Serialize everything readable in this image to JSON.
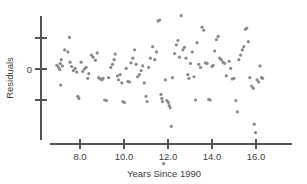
{
  "chart_data": {
    "type": "scatter",
    "title": "",
    "xlabel": "Years Since 1990",
    "ylabel": "Residuals",
    "xlim": [
      6.7,
      16.9
    ],
    "ylim": [
      -3.4,
      2.4
    ],
    "grid": false,
    "legend": null,
    "xticks": [
      8.0,
      10.0,
      12.0,
      14.0,
      16.0
    ],
    "xticklabels": [
      "8.0",
      "10.0",
      "12.0",
      "14.0",
      "16.0"
    ],
    "yticks": [
      -1.0,
      0.0,
      1.0
    ],
    "yticklabels": [
      "",
      "0",
      ""
    ],
    "point_color": "#8a8a8a",
    "axis_color": "#555555",
    "point_radius": 1.6,
    "points": [
      [
        6.95,
        0.12
      ],
      [
        7.02,
        0.05
      ],
      [
        7.1,
        0.18
      ],
      [
        7.08,
        -0.02
      ],
      [
        7.15,
        0.3
      ],
      [
        7.2,
        0.1
      ],
      [
        7.12,
        -0.52
      ],
      [
        7.3,
        0.62
      ],
      [
        7.45,
        0.55
      ],
      [
        7.52,
        1.02
      ],
      [
        7.55,
        0.22
      ],
      [
        7.62,
        0.08
      ],
      [
        7.7,
        -0.05
      ],
      [
        7.78,
        0.02
      ],
      [
        7.85,
        -0.1
      ],
      [
        7.9,
        -0.88
      ],
      [
        7.95,
        -0.95
      ],
      [
        8.05,
        0.22
      ],
      [
        8.12,
        -0.08
      ],
      [
        8.2,
        0.0
      ],
      [
        8.28,
        0.05
      ],
      [
        8.35,
        -0.3
      ],
      [
        8.4,
        -0.15
      ],
      [
        8.52,
        0.45
      ],
      [
        8.6,
        0.38
      ],
      [
        8.7,
        0.28
      ],
      [
        8.78,
        0.52
      ],
      [
        8.85,
        -0.28
      ],
      [
        8.92,
        -0.32
      ],
      [
        9.0,
        -0.35
      ],
      [
        9.05,
        -0.3
      ],
      [
        9.12,
        -1.0
      ],
      [
        9.2,
        -1.02
      ],
      [
        9.3,
        -0.28
      ],
      [
        9.4,
        0.05
      ],
      [
        9.48,
        0.15
      ],
      [
        9.55,
        0.3
      ],
      [
        9.6,
        0.48
      ],
      [
        9.7,
        -0.22
      ],
      [
        9.75,
        -0.35
      ],
      [
        9.82,
        -0.18
      ],
      [
        9.9,
        -0.45
      ],
      [
        9.95,
        -1.05
      ],
      [
        10.02,
        -1.08
      ],
      [
        10.1,
        0.02
      ],
      [
        10.18,
        -0.4
      ],
      [
        10.25,
        -0.42
      ],
      [
        10.32,
        0.2
      ],
      [
        10.4,
        0.35
      ],
      [
        10.48,
        0.62
      ],
      [
        10.55,
        0.15
      ],
      [
        10.62,
        -0.25
      ],
      [
        10.7,
        -0.18
      ],
      [
        10.78,
        -0.05
      ],
      [
        10.85,
        0.1
      ],
      [
        10.92,
        -0.45
      ],
      [
        11.0,
        -0.88
      ],
      [
        11.05,
        -1.05
      ],
      [
        11.12,
        0.05
      ],
      [
        11.2,
        0.35
      ],
      [
        11.3,
        0.72
      ],
      [
        11.4,
        0.3
      ],
      [
        11.48,
        0.55
      ],
      [
        11.55,
        1.55
      ],
      [
        11.62,
        1.58
      ],
      [
        11.68,
        -0.82
      ],
      [
        11.72,
        -0.95
      ],
      [
        11.75,
        -1.05
      ],
      [
        11.8,
        -3.05
      ],
      [
        11.88,
        -0.35
      ],
      [
        11.95,
        -1.02
      ],
      [
        12.02,
        -1.08
      ],
      [
        12.05,
        -1.18
      ],
      [
        12.1,
        -1.25
      ],
      [
        12.15,
        -1.85
      ],
      [
        12.2,
        -0.28
      ],
      [
        12.3,
        0.5
      ],
      [
        12.38,
        0.78
      ],
      [
        12.45,
        0.92
      ],
      [
        12.52,
        0.38
      ],
      [
        12.6,
        1.72
      ],
      [
        12.68,
        0.62
      ],
      [
        12.75,
        0.7
      ],
      [
        12.82,
        0.35
      ],
      [
        12.9,
        -0.18
      ],
      [
        12.95,
        -0.3
      ],
      [
        13.02,
        0.18
      ],
      [
        13.1,
        0.55
      ],
      [
        13.18,
        -0.25
      ],
      [
        13.25,
        -1.0
      ],
      [
        13.32,
        0.85
      ],
      [
        13.4,
        0.15
      ],
      [
        13.48,
        0.05
      ],
      [
        13.55,
        1.35
      ],
      [
        13.62,
        1.25
      ],
      [
        13.7,
        0.2
      ],
      [
        13.78,
        0.18
      ],
      [
        13.85,
        -0.98
      ],
      [
        13.92,
        -1.0
      ],
      [
        14.0,
        0.08
      ],
      [
        14.05,
        0.12
      ],
      [
        14.12,
        0.58
      ],
      [
        14.2,
        0.95
      ],
      [
        14.28,
        1.05
      ],
      [
        14.35,
        0.35
      ],
      [
        14.42,
        0.3
      ],
      [
        14.5,
        0.22
      ],
      [
        14.58,
        0.18
      ],
      [
        14.65,
        -0.22
      ],
      [
        14.78,
        0.25
      ],
      [
        14.85,
        0.02
      ],
      [
        14.92,
        -0.32
      ],
      [
        15.0,
        -0.3
      ],
      [
        15.08,
        -1.02
      ],
      [
        15.15,
        -1.38
      ],
      [
        15.22,
        0.3
      ],
      [
        15.3,
        0.45
      ],
      [
        15.38,
        0.62
      ],
      [
        15.45,
        0.72
      ],
      [
        15.52,
        1.28
      ],
      [
        15.58,
        1.32
      ],
      [
        15.65,
        0.88
      ],
      [
        15.72,
        -0.28
      ],
      [
        15.8,
        -0.55
      ],
      [
        15.88,
        -0.62
      ],
      [
        15.92,
        -1.78
      ],
      [
        15.98,
        -2.05
      ],
      [
        16.05,
        -0.35
      ],
      [
        16.12,
        -0.42
      ],
      [
        16.18,
        0.1
      ],
      [
        16.25,
        -0.28
      ],
      [
        16.3,
        -0.3
      ]
    ]
  }
}
